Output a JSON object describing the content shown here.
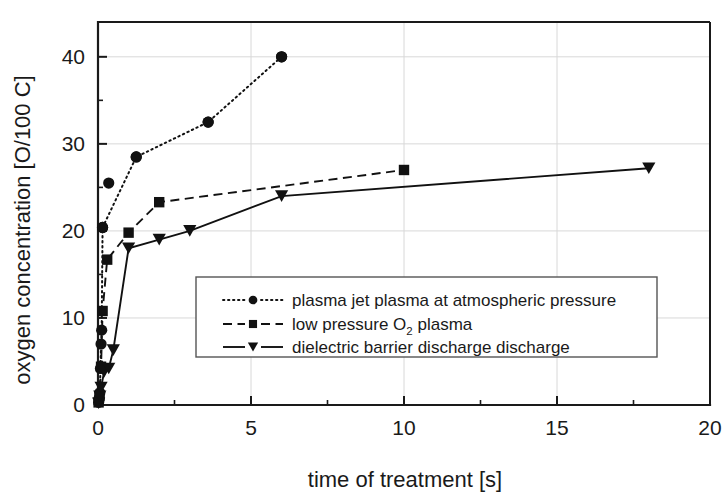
{
  "chart_data": {
    "type": "line",
    "title": "",
    "xlabel": "time of treatment [s]",
    "ylabel": "oxygen concentration [O/100 C]",
    "xlim": [
      0,
      20
    ],
    "ylim": [
      0,
      44
    ],
    "xticks": [
      0,
      5,
      10,
      15,
      20
    ],
    "xtick_labels": [
      "0",
      "5",
      "10",
      "15",
      "20"
    ],
    "yticks": [
      0,
      10,
      20,
      30,
      40
    ],
    "ytick_labels": [
      "0",
      "10",
      "20",
      "30",
      "40"
    ],
    "x_minor_ticks": [
      2.5,
      7.5,
      12.5,
      17.5
    ],
    "y_minor_ticks": [
      5,
      15,
      25,
      35
    ],
    "grid": true,
    "legend_position": "center-right-inside",
    "series": [
      {
        "name": "plasma jet plasma at atmospheric pressure",
        "marker": "circle",
        "linestyle": "dotted",
        "x": [
          0.02,
          0.04,
          0.06,
          0.08,
          0.1,
          0.12,
          0.15,
          1.25,
          3.6,
          6.0
        ],
        "y": [
          0.3,
          0.8,
          1.4,
          4.2,
          7.0,
          8.6,
          20.4,
          28.5,
          32.5,
          40.0
        ],
        "labeled_points": [
          {
            "x": 0.15,
            "y": 20.4
          },
          {
            "x": 0.35,
            "y": 25.5
          },
          {
            "x": 1.25,
            "y": 28.5
          },
          {
            "x": 3.6,
            "y": 32.5
          },
          {
            "x": 6.0,
            "y": 40.0
          }
        ]
      },
      {
        "name": "low pressure O2 plasma",
        "name_base": "low pressure O",
        "name_sub": "2",
        "name_tail": " plasma",
        "marker": "square",
        "linestyle": "dashed",
        "x": [
          0.02,
          0.05,
          0.1,
          0.15,
          0.3,
          1.0,
          2.0,
          10.0
        ],
        "y": [
          0.3,
          1.0,
          4.4,
          10.8,
          16.7,
          19.8,
          23.3,
          27.0
        ]
      },
      {
        "name": "dielectric barrier discharge discharge",
        "marker": "triangle-down",
        "linestyle": "solid",
        "x": [
          0.02,
          0.06,
          0.1,
          0.2,
          0.35,
          0.5,
          1.0,
          2.0,
          3.0,
          6.0,
          18.0
        ],
        "y": [
          0.2,
          1.0,
          2.0,
          3.8,
          4.2,
          6.3,
          18.0,
          19.0,
          20.0,
          24.0,
          27.2
        ]
      }
    ]
  },
  "legend": {
    "entries": [
      {
        "label": "plasma jet plasma at atmospheric pressure",
        "marker": "circle",
        "linestyle": "dotted"
      },
      {
        "label_base": "low pressure O",
        "label_sub": "2",
        "label_tail": " plasma",
        "marker": "square",
        "linestyle": "dashed"
      },
      {
        "label": "dielectric barrier discharge discharge",
        "marker": "triangle-down",
        "linestyle": "solid"
      }
    ]
  },
  "colors": {
    "ink": "#111111",
    "axis": "#1a1a1a",
    "grid": "#d8d8d8",
    "background": "#ffffff",
    "legend_border": "#555555"
  }
}
